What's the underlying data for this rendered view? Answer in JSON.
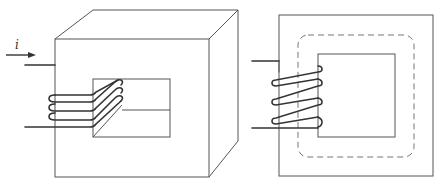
{
  "diagram": {
    "current_label": "i",
    "colors": {
      "stroke": "#555555",
      "wire": "#333333",
      "flux_path": "#777777",
      "background": "#ffffff"
    },
    "left_figure": {
      "description": "3D core with rectangular window, coil wound on left leg",
      "turns": 3
    },
    "right_figure": {
      "description": "Front view of core with coil and dashed mean flux path",
      "turns": 3
    }
  }
}
